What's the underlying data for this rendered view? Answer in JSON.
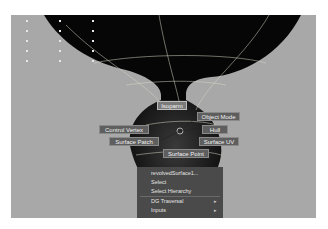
{
  "viewport": {
    "background": "#a8a8a8",
    "object_color": "#0a0a0a",
    "wireframe_color": "#d8d8c8"
  },
  "marking_menu": {
    "north": "Isoparm",
    "north_east": "Object Mode",
    "east": "Hull",
    "south_east": "Surface UV",
    "south": "Surface Point",
    "south_west": "Surface Patch",
    "west": "Control Vertex"
  },
  "context_menu": {
    "items": [
      {
        "label": "revolvedSurface1...",
        "submenu": false
      },
      {
        "label": "Select",
        "submenu": false
      },
      {
        "label": "Select Hierarchy",
        "submenu": false
      },
      {
        "label": "DG Traversal",
        "submenu": true
      },
      {
        "label": "Inputs",
        "submenu": true
      }
    ],
    "submenu_arrow": "▸"
  }
}
